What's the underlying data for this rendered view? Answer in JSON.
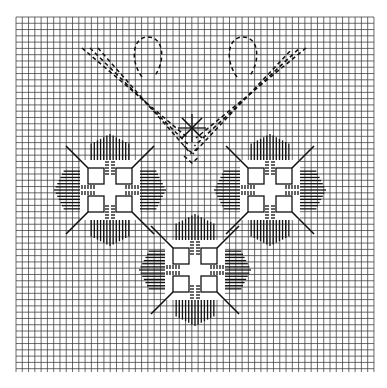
{
  "diagram": {
    "type": "needlepoint-chart",
    "background": "#ffffff",
    "ink": "#111111",
    "grid": {
      "x0": 16,
      "y0": 17,
      "x1": 374,
      "y1": 372,
      "cell": 6.28,
      "color": "#3a3a3a"
    },
    "motifs": [
      {
        "name": "left-square-motif",
        "cx": 110,
        "cy": 190
      },
      {
        "name": "right-square-motif",
        "cx": 270,
        "cy": 190
      },
      {
        "name": "bottom-square-motif",
        "cx": 195,
        "cy": 270
      }
    ],
    "center_cross": {
      "cx": 192,
      "cy": 128
    },
    "loops": [
      {
        "name": "left-loop",
        "cx": 148,
        "cy": 55
      },
      {
        "name": "right-loop",
        "cx": 243,
        "cy": 55
      }
    ]
  }
}
